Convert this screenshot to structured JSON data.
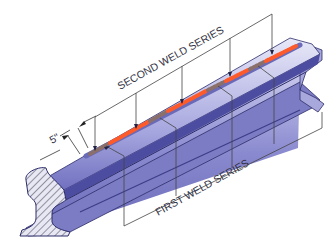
{
  "diagram": {
    "labels": {
      "second_series": "SECOND WELD SERIES",
      "first_series": "FIRST WELD SERIES",
      "spacing_dim": "5\""
    },
    "colors": {
      "rail_light": "#d8d8f0",
      "rail_mid": "#9a9ad8",
      "rail_dark": "#5a5aa8",
      "rail_edge": "#2c2c6a",
      "weld_first": "#8a6f6a",
      "weld_second": "#ff5a2a",
      "weld_glow": "#ffb09a",
      "leader": "#444444",
      "section_hatch": "#555566"
    },
    "weld_segments": [
      {
        "series": "first"
      },
      {
        "series": "second"
      },
      {
        "series": "first"
      },
      {
        "series": "second"
      },
      {
        "series": "first"
      },
      {
        "series": "second"
      },
      {
        "series": "first"
      },
      {
        "series": "second"
      }
    ]
  }
}
